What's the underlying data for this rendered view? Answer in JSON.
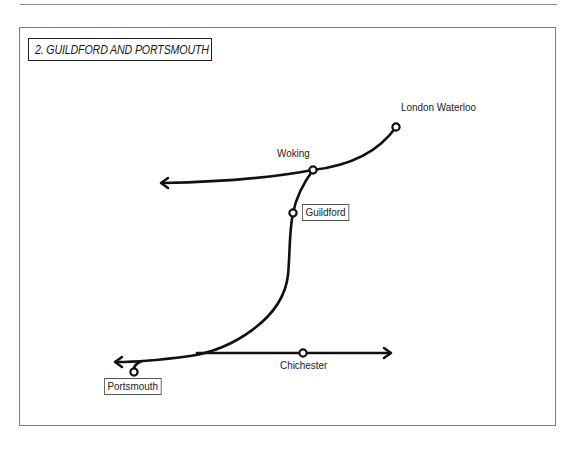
{
  "map": {
    "title": "2. GUILDFORD AND PORTSMOUTH",
    "line_color": "#111111",
    "stations": [
      {
        "id": "london-waterloo",
        "label": "London Waterloo",
        "boxed": false,
        "x": 396,
        "y": 127
      },
      {
        "id": "woking",
        "label": "Woking",
        "boxed": false,
        "x": 313,
        "y": 170
      },
      {
        "id": "guildford",
        "label": "Guildford",
        "boxed": true,
        "x": 293,
        "y": 213
      },
      {
        "id": "chichester",
        "label": "Chichester",
        "boxed": false,
        "x": 303,
        "y": 353
      },
      {
        "id": "portsmouth",
        "label": "Portsmouth",
        "boxed": true,
        "x": 134,
        "y": 372
      }
    ],
    "arrows": [
      {
        "id": "west-from-woking",
        "direction": "left"
      },
      {
        "id": "west-from-junction",
        "direction": "left"
      },
      {
        "id": "east-past-chichester",
        "direction": "right"
      }
    ]
  }
}
